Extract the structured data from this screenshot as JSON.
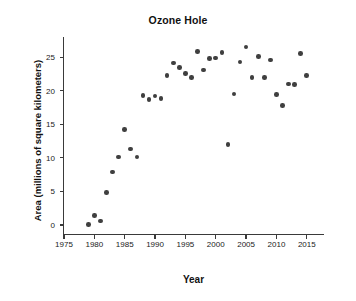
{
  "chart_data": {
    "type": "scatter",
    "title": "Ozone Hole",
    "xlabel": "Year",
    "ylabel": "Area (millions of square kilometers)",
    "xlim": [
      1975,
      2018
    ],
    "ylim": [
      -1.5,
      28
    ],
    "grid": false,
    "legend": null,
    "xticks": [
      1975,
      1980,
      1985,
      1990,
      1995,
      2000,
      2005,
      2010,
      2015
    ],
    "yticks": [
      0,
      5,
      10,
      15,
      20,
      25
    ],
    "marker_color": "#3f3f3f",
    "x": [
      1979,
      1980,
      1981,
      1982,
      1983,
      1984,
      1985,
      1986,
      1987,
      1988,
      1989,
      1990,
      1991,
      1992,
      1993,
      1994,
      1995,
      1996,
      1997,
      1998,
      1999,
      2000,
      2001,
      2002,
      2003,
      2004,
      2005,
      2006,
      2007,
      2008,
      2009,
      2010,
      2011,
      2012,
      2013,
      2014,
      2015
    ],
    "y": [
      0.1,
      1.4,
      0.6,
      4.8,
      7.9,
      10.1,
      14.2,
      11.3,
      19.3,
      18.7,
      19.2,
      18.8,
      22.3,
      24.1,
      23.5,
      22.6,
      22.0,
      25.8,
      23.1,
      24.8,
      24.9,
      25.7,
      19.5,
      12.0,
      24.3,
      26.5,
      22.0,
      25.1,
      22.0,
      19.4,
      24.6,
      17.8,
      21.0,
      20.9,
      25.5,
      22.3,
      21.0
    ],
    "points": [
      {
        "year": 1979,
        "area": 0.1
      },
      {
        "year": 1980,
        "area": 1.4
      },
      {
        "year": 1981,
        "area": 0.6
      },
      {
        "year": 1982,
        "area": 4.8
      },
      {
        "year": 1983,
        "area": 7.9
      },
      {
        "year": 1984,
        "area": 10.1
      },
      {
        "year": 1985,
        "area": 14.2
      },
      {
        "year": 1986,
        "area": 11.3
      },
      {
        "year": 1987,
        "area": 10.1
      },
      {
        "year": 1988,
        "area": 19.3
      },
      {
        "year": 1989,
        "area": 18.7
      },
      {
        "year": 1990,
        "area": 19.2
      },
      {
        "year": 1991,
        "area": 18.8
      },
      {
        "year": 1992,
        "area": 22.3
      },
      {
        "year": 1993,
        "area": 24.1
      },
      {
        "year": 1994,
        "area": 23.5
      },
      {
        "year": 1995,
        "area": 22.6
      },
      {
        "year": 1996,
        "area": 22.0
      },
      {
        "year": 1997,
        "area": 25.8
      },
      {
        "year": 1998,
        "area": 23.1
      },
      {
        "year": 1999,
        "area": 24.8
      },
      {
        "year": 2000,
        "area": 24.9
      },
      {
        "year": 2001,
        "area": 25.7
      },
      {
        "year": 2002,
        "area": 12.0
      },
      {
        "year": 2003,
        "area": 19.5
      },
      {
        "year": 2004,
        "area": 24.3
      },
      {
        "year": 2005,
        "area": 26.5
      },
      {
        "year": 2006,
        "area": 22.0
      },
      {
        "year": 2007,
        "area": 25.1
      },
      {
        "year": 2008,
        "area": 22.0
      },
      {
        "year": 2009,
        "area": 24.6
      },
      {
        "year": 2010,
        "area": 19.4
      },
      {
        "year": 2011,
        "area": 17.8
      },
      {
        "year": 2012,
        "area": 21.0
      },
      {
        "year": 2013,
        "area": 20.9
      },
      {
        "year": 2014,
        "area": 25.5
      },
      {
        "year": 2015,
        "area": 22.3
      }
    ]
  }
}
